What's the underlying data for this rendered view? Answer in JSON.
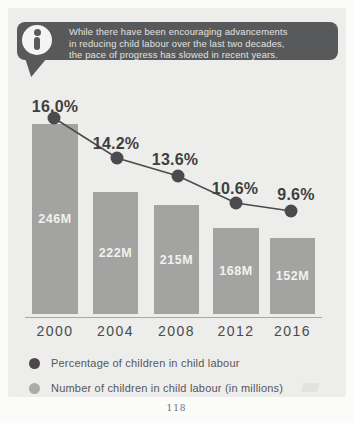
{
  "callout": {
    "lines": [
      "While there have been encouraging advancements",
      "in reducing child labour over the last two decades,",
      "the pace of progress has slowed in recent years."
    ]
  },
  "chart_data": {
    "type": "combo",
    "categories": [
      "2000",
      "2004",
      "2008",
      "2012",
      "2016"
    ],
    "series": [
      {
        "name": "Percentage of children in child labour",
        "type": "line",
        "values": [
          16.0,
          14.2,
          13.6,
          10.6,
          9.6
        ],
        "unit": "%",
        "labels": [
          "16.0%",
          "14.2%",
          "13.6%",
          "10.6%",
          "9.6%"
        ],
        "color": "#4b4b4d"
      },
      {
        "name": "Number of children in child labour (in millions)",
        "type": "bar",
        "values": [
          246,
          222,
          215,
          168,
          152
        ],
        "unit": "M",
        "labels": [
          "246M",
          "222M",
          "215M",
          "168M",
          "152M"
        ],
        "color": "#a3a4a2"
      }
    ],
    "title": "",
    "xlabel": "",
    "ylabel": "",
    "grid": false,
    "legend_position": "bottom",
    "layout_px": {
      "baseline_y": 314,
      "bars": [
        {
          "left": 32,
          "top": 124,
          "width": 46
        },
        {
          "left": 93,
          "top": 192,
          "width": 45
        },
        {
          "left": 154,
          "top": 205,
          "width": 45
        },
        {
          "left": 213,
          "top": 228,
          "width": 46
        },
        {
          "left": 270,
          "top": 238,
          "width": 45
        }
      ],
      "dots": [
        {
          "x": 54,
          "y": 118
        },
        {
          "x": 117,
          "y": 158
        },
        {
          "x": 178,
          "y": 176
        },
        {
          "x": 236,
          "y": 203
        },
        {
          "x": 291,
          "y": 211
        }
      ],
      "pct_labels": [
        {
          "x": 55,
          "top": 98
        },
        {
          "x": 116,
          "top": 135
        },
        {
          "x": 175,
          "top": 151
        },
        {
          "x": 235,
          "top": 180
        },
        {
          "x": 296,
          "top": 186
        }
      ],
      "dot_radius": 6.5
    }
  },
  "legend": {
    "items": [
      {
        "label": "Percentage of children in child labour",
        "color": "#4d474a"
      },
      {
        "label": "Number of children in child labour (in millions)",
        "color": "#ababa9"
      }
    ]
  },
  "page_number": "118",
  "colors": {
    "page_bg": "#fbfbfa",
    "card_bg": "#ededeb",
    "bubble_bg": "#58595b",
    "bubble_text": "#e2e2e1",
    "bar": "#a3a4a2",
    "line": "#4b4b4d",
    "pct_text": "#3e3f41",
    "year_text": "#4a4a4c"
  }
}
